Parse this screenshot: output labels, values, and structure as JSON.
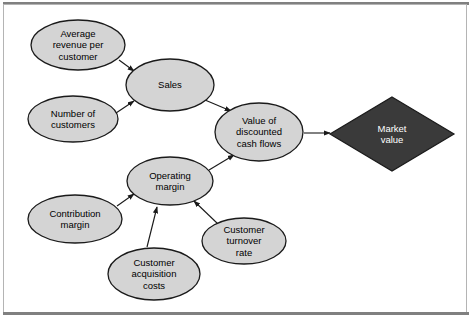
{
  "diagram": {
    "frame": {
      "border_color": "#b4b4b4",
      "rule_color": "#808080",
      "background": "#ffffff"
    },
    "style": {
      "ellipse_fill": "#d4d4d4",
      "ellipse_stroke": "#1a1a1a",
      "diamond_fill": "#3a3a3a",
      "diamond_stroke": "#1a1a1a",
      "diamond_text_color": "#ffffff",
      "arrow_color": "#1a1a1a",
      "text_color": "#000000"
    },
    "nodes": [
      {
        "id": "average-revenue-per-customer",
        "shape": "ellipse",
        "label": "Average revenue per customer",
        "lines": [
          "Average",
          "revenue per",
          "customer"
        ],
        "cx": 78,
        "cy": 45,
        "rx": 47,
        "ry": 25
      },
      {
        "id": "number-of-customers",
        "shape": "ellipse",
        "label": "Number of customers",
        "lines": [
          "Number of",
          "customers"
        ],
        "cx": 73,
        "cy": 119,
        "rx": 45,
        "ry": 23
      },
      {
        "id": "sales",
        "shape": "ellipse",
        "label": "Sales",
        "lines": [
          "Sales"
        ],
        "cx": 170,
        "cy": 85,
        "rx": 44,
        "ry": 26
      },
      {
        "id": "value-of-discounted-cash-flows",
        "shape": "ellipse",
        "label": "Value of discounted cash flows",
        "lines": [
          "Value of",
          "discounted",
          "cash flows"
        ],
        "cx": 259,
        "cy": 132,
        "rx": 44,
        "ry": 29
      },
      {
        "id": "market-value",
        "shape": "diamond",
        "label": "Market value",
        "lines": [
          "Market",
          "value"
        ],
        "cx": 392,
        "cy": 134,
        "rx": 62,
        "ry": 37
      },
      {
        "id": "operating-margin",
        "shape": "ellipse",
        "label": "Operating margin",
        "lines": [
          "Operating",
          "margin"
        ],
        "cx": 170,
        "cy": 181,
        "rx": 43,
        "ry": 24
      },
      {
        "id": "contribution-margin",
        "shape": "ellipse",
        "label": "Contribution margin",
        "lines": [
          "Contribution",
          "margin"
        ],
        "cx": 75,
        "cy": 219,
        "rx": 47,
        "ry": 24
      },
      {
        "id": "customer-acquisition-costs",
        "shape": "ellipse",
        "label": "Customer acquisition costs",
        "lines": [
          "Customer",
          "acquisition",
          "costs"
        ],
        "cx": 154,
        "cy": 274,
        "rx": 46,
        "ry": 26
      },
      {
        "id": "customer-turnover-rate",
        "shape": "ellipse",
        "label": "Customer turnover rate",
        "lines": [
          "Customer",
          "turnover",
          "rate"
        ],
        "cx": 244,
        "cy": 241,
        "rx": 42,
        "ry": 23
      }
    ],
    "edges": [
      {
        "id": "edge-arpc-to-sales",
        "from": "average-revenue-per-customer",
        "to": "sales",
        "x1": 119,
        "y1": 60,
        "x2": 134,
        "y2": 71
      },
      {
        "id": "edge-customers-to-sales",
        "from": "number-of-customers",
        "to": "sales",
        "x1": 116,
        "y1": 113,
        "x2": 134,
        "y2": 101
      },
      {
        "id": "edge-sales-to-dcf",
        "from": "sales",
        "to": "value-of-discounted-cash-flows",
        "x1": 205,
        "y1": 100,
        "x2": 231,
        "y2": 111
      },
      {
        "id": "edge-dcf-to-market-value",
        "from": "value-of-discounted-cash-flows",
        "to": "market-value",
        "x1": 304,
        "y1": 133,
        "x2": 330,
        "y2": 133
      },
      {
        "id": "edge-opmargin-to-dcf",
        "from": "operating-margin",
        "to": "value-of-discounted-cash-flows",
        "x1": 209,
        "y1": 170,
        "x2": 234,
        "y2": 155
      },
      {
        "id": "edge-contribution-to-opmargin",
        "from": "contribution-margin",
        "to": "operating-margin",
        "x1": 117,
        "y1": 206,
        "x2": 134,
        "y2": 194
      },
      {
        "id": "edge-acquisition-to-opmargin",
        "from": "customer-acquisition-costs",
        "to": "operating-margin",
        "x1": 147,
        "y1": 247,
        "x2": 157,
        "y2": 207
      },
      {
        "id": "edge-turnover-to-opmargin",
        "from": "customer-turnover-rate",
        "to": "operating-margin",
        "x1": 218,
        "y1": 224,
        "x2": 194,
        "y2": 201
      }
    ]
  }
}
